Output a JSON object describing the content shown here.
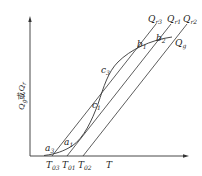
{
  "diagram": {
    "type": "line-intersection diagram",
    "axes": {
      "x_label": "T",
      "y_label": "Q_g或Q_r",
      "y_label_parts": {
        "q1": "Q",
        "s1": "g",
        "mid": "或",
        "q2": "Q",
        "s2": "r"
      }
    },
    "x_ticks": [
      {
        "main": "T",
        "sub": "03"
      },
      {
        "main": "T",
        "sub": "01"
      },
      {
        "main": "T",
        "sub": "02"
      }
    ],
    "curves": {
      "heat_generation": {
        "main": "Q",
        "sub": "g"
      }
    },
    "lines": [
      {
        "main": "Q",
        "sub": "r3"
      },
      {
        "main": "Q",
        "sub": "r1"
      },
      {
        "main": "Q",
        "sub": "r2"
      }
    ],
    "points": [
      {
        "main": "a",
        "sub": "3"
      },
      {
        "main": "a",
        "sub": "1"
      },
      {
        "main": "c",
        "sub": "1"
      },
      {
        "main": "c",
        "sub": "3"
      },
      {
        "main": "b",
        "sub": "1"
      },
      {
        "main": "b",
        "sub": "2"
      }
    ],
    "colors": {
      "stroke": "#333333",
      "background": "#ffffff"
    }
  }
}
